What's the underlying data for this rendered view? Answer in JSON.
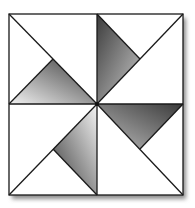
{
  "diagram": {
    "type": "quilt-block",
    "name": "Pinwheel block",
    "frame": {
      "x": 9,
      "y": 14,
      "width": 174,
      "height": 181
    },
    "center": {
      "x": 97,
      "y": 104
    },
    "colors": {
      "background": "#ffffff",
      "line": "#1a1a1a",
      "shade_light": "#e6e6e6",
      "shade_dark": "#4a4a4a",
      "shadow": "#9a9a9a"
    },
    "shaded_triangles": [
      {
        "quadrant": "top-left",
        "points": "9,104 97,104 53,59"
      },
      {
        "quadrant": "top-right",
        "points": "97,14 97,104 140,59"
      },
      {
        "quadrant": "bottom-right",
        "points": "183,104 97,104 140,149"
      },
      {
        "quadrant": "bottom-left",
        "points": "97,195 97,104 53,149"
      }
    ]
  }
}
